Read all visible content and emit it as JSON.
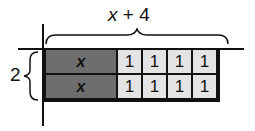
{
  "diagram": {
    "type": "area-model",
    "top_label": {
      "var": "x",
      "rest": " + 4"
    },
    "side_label": "2",
    "rows": [
      {
        "tiles": [
          "x",
          "1",
          "1",
          "1",
          "1"
        ]
      },
      {
        "tiles": [
          "x",
          "1",
          "1",
          "1",
          "1"
        ]
      }
    ],
    "colors": {
      "x_tile": "#6e6e6e",
      "unit_tile": "#e3e3e3",
      "line": "#111111"
    }
  }
}
